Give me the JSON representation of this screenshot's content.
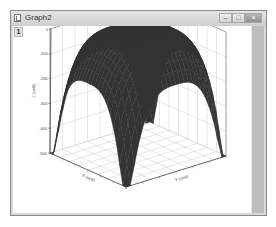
{
  "window": {
    "title": "Graph2",
    "layer_tab": "1",
    "controls": {
      "minimize": "–",
      "maximize": "□",
      "close": "×"
    }
  },
  "chart_data": {
    "type": "surface",
    "title": "",
    "surface_color": "#333333",
    "zlabel": "Z (unit)",
    "xlabel": "X (unit)",
    "ylabel": "Y (unit)",
    "zlim": [
      -500,
      0
    ],
    "z_ticks": [
      "0",
      "-100",
      "-200",
      "-300",
      "-400",
      "-500"
    ],
    "x_ticks": [
      "",
      "",
      "",
      "",
      "",
      ""
    ],
    "y_ticks": [
      "",
      "",
      "",
      "",
      "",
      ""
    ],
    "grid": true,
    "z_peak": 0,
    "z_corner_min": -500
  }
}
